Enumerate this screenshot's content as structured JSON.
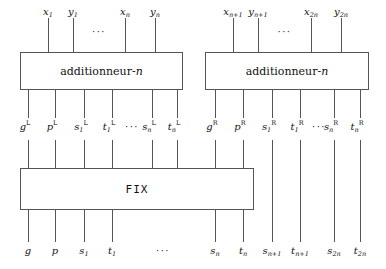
{
  "diagram": {
    "ellipsis": "···",
    "boxes": [
      {
        "id": "adder-left",
        "label_text": "additionneur-",
        "label_italic": "n"
      },
      {
        "id": "adder-right",
        "label_text": "additionneur-",
        "label_italic": "n"
      },
      {
        "id": "fix",
        "label_text": "FIX"
      }
    ],
    "top_inputs_left": [
      {
        "base": "x",
        "sub": "1"
      },
      {
        "base": "y",
        "sub": "1"
      },
      {
        "base": "x",
        "sub": "n"
      },
      {
        "base": "y",
        "sub": "n"
      }
    ],
    "top_inputs_right": [
      {
        "base": "x",
        "sub": "n+1"
      },
      {
        "base": "y",
        "sub": "n+1"
      },
      {
        "base": "x",
        "sub": "2n"
      },
      {
        "base": "y",
        "sub": "2n"
      }
    ],
    "mid_left": [
      {
        "base": "g",
        "sub": "",
        "sup": "L"
      },
      {
        "base": "p",
        "sub": "",
        "sup": "L"
      },
      {
        "base": "s",
        "sub": "1",
        "sup": "L"
      },
      {
        "base": "t",
        "sub": "1",
        "sup": "L"
      },
      {
        "base": "s",
        "sub": "n",
        "sup": "L"
      },
      {
        "base": "t",
        "sub": "n",
        "sup": "L"
      }
    ],
    "mid_right": [
      {
        "base": "g",
        "sub": "",
        "sup": "R"
      },
      {
        "base": "p",
        "sub": "",
        "sup": "R"
      },
      {
        "base": "s",
        "sub": "1",
        "sup": "R"
      },
      {
        "base": "t",
        "sub": "1",
        "sup": "R"
      },
      {
        "base": "s",
        "sub": "n",
        "sup": "R"
      },
      {
        "base": "t",
        "sub": "n",
        "sup": "R"
      }
    ],
    "bottom_outputs": [
      {
        "base": "g",
        "sub": ""
      },
      {
        "base": "p",
        "sub": ""
      },
      {
        "base": "s",
        "sub": "1"
      },
      {
        "base": "t",
        "sub": "1"
      },
      {
        "base": "s",
        "sub": "n"
      },
      {
        "base": "t",
        "sub": "n"
      },
      {
        "base": "s",
        "sub": "n+1"
      },
      {
        "base": "t",
        "sub": "n+1"
      },
      {
        "base": "s",
        "sub": "2n"
      },
      {
        "base": "t",
        "sub": "2n"
      }
    ],
    "colors": {
      "line": "#555555",
      "text": "#111111",
      "background": "#ffffff"
    }
  }
}
